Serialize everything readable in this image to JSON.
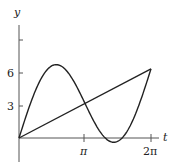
{
  "chart_data": {
    "type": "line",
    "title": "",
    "xlabel": "t",
    "ylabel": "y",
    "xlim": [
      0,
      6.8
    ],
    "ylim": [
      -1.5,
      10.2
    ],
    "x_ticks": [
      {
        "value": 3.14159,
        "label": "π"
      },
      {
        "value": 6.28318,
        "label": "2π"
      }
    ],
    "y_ticks": [
      {
        "value": 3,
        "label": "3"
      },
      {
        "value": 6,
        "label": "6"
      },
      {
        "value": 9,
        "label": ""
      }
    ],
    "grid": false,
    "legend": null,
    "series": [
      {
        "name": "y = t",
        "x": [
          0,
          6.28318
        ],
        "values": [
          0,
          6.28318
        ]
      },
      {
        "name": "y = t + 5 sin t",
        "x": [
          0,
          0.5,
          1.0,
          1.5,
          1.77,
          2.0,
          2.5,
          3.0,
          3.14159,
          3.5,
          4.0,
          4.5,
          5.0,
          5.5,
          6.0,
          6.28318
        ],
        "values": [
          0,
          2.9,
          5.21,
          6.49,
          6.67,
          6.55,
          5.49,
          3.71,
          3.14,
          1.75,
          0.22,
          -0.39,
          0.21,
          1.89,
          4.6,
          6.28
        ]
      }
    ]
  },
  "labels": {
    "y_axis": "y",
    "x_axis": "t",
    "tick_3": "3",
    "tick_6": "6",
    "tick_pi": "π",
    "tick_2pi": "2π"
  }
}
